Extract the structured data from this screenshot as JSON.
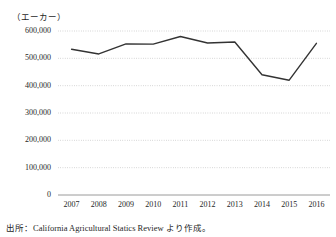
{
  "figure": {
    "unit_label": "（エーカー）",
    "source_note": "出所：California Agricultural Statics Review より作成。"
  },
  "chart_data": {
    "type": "line",
    "title": "",
    "subtitle": "",
    "xlabel": "",
    "ylabel": "（エーカー）",
    "categories": [
      "2007",
      "2008",
      "2009",
      "2010",
      "2011",
      "2012",
      "2013",
      "2014",
      "2015",
      "2016"
    ],
    "values": [
      533000,
      516000,
      553000,
      552000,
      580000,
      556000,
      560000,
      440000,
      420000,
      555000
    ],
    "series": [
      {
        "name": "作付面積",
        "values": [
          533000,
          516000,
          553000,
          552000,
          580000,
          556000,
          560000,
          440000,
          420000,
          555000
        ]
      }
    ],
    "ylim": [
      0,
      600000
    ],
    "ytick_labels": [
      "0",
      "100,000",
      "200,000",
      "300,000",
      "400,000",
      "500,000",
      "600,000"
    ],
    "ytick_values": [
      0,
      100000,
      200000,
      300000,
      400000,
      500000,
      600000
    ],
    "xtick_labels": [
      "2007",
      "2008",
      "2009",
      "2010",
      "2011",
      "2012",
      "2013",
      "2014",
      "2015",
      "2016"
    ],
    "grid": "horizontal-dotted",
    "legend": "none",
    "line_color": "#333333",
    "grid_color": "#b8b8b8",
    "axis_color": "#9a9a9a"
  }
}
